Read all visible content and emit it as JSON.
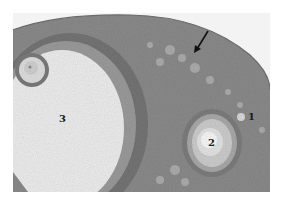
{
  "figure": {
    "type": "histology-micrograph",
    "colors": {
      "background": "#f3f3f3",
      "tissue": "#8a8a8a",
      "tissue_dark": "#6e6e6e",
      "cortex_band": "#7a7a7a",
      "antrum": "#ececec",
      "follicle_light": "#dcdcdc",
      "oocyte": "#f7f7f7"
    },
    "labels": [
      {
        "id": "1",
        "text": "1",
        "x": 248,
        "y": 112
      },
      {
        "id": "2",
        "text": "2",
        "x": 208,
        "y": 138
      },
      {
        "id": "3",
        "text": "3",
        "x": 59,
        "y": 114
      }
    ],
    "arrow": {
      "icon": "arrow-down-left-icon",
      "from": [
        208,
        30
      ],
      "to": [
        195,
        52
      ]
    }
  }
}
